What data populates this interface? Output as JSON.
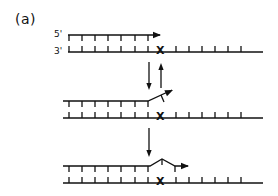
{
  "figure": {
    "panel_label": "(a)",
    "strand_labels": {
      "five_prime": "5'",
      "three_prime": "3'"
    },
    "mismatch_mark": "X",
    "colors": {
      "ink": "#111111",
      "background": "#ffffff"
    },
    "stages": [
      {
        "name": "primer-annealed",
        "description": "Primer annealed to template, extension stops before mismatch X",
        "primer_y": 35,
        "template_y": 52,
        "primer_path": [
          [
            68,
            35
          ],
          [
            160,
            35
          ]
        ],
        "primer_ticks_x": [
          69,
          82,
          95,
          108,
          121,
          135,
          148
        ],
        "template_x_range": [
          68,
          263
        ],
        "template_ticks_x": [
          69,
          82,
          95,
          108,
          121,
          135,
          148,
          176,
          189,
          202,
          215,
          228,
          241
        ],
        "x_mark_x": 161
      },
      {
        "name": "primer-terminus-frayed",
        "description": "Primer 3' end displaced away from template at mismatch",
        "primer_y": 101,
        "template_y": 118,
        "primer_path": [
          [
            63,
            101
          ],
          [
            148,
            101
          ],
          [
            172,
            90
          ]
        ],
        "primer_ticks_x": [
          69,
          82,
          95,
          108,
          121,
          135,
          148
        ],
        "frayed_tick": [
          [
            161,
            95
          ],
          [
            164,
            102
          ]
        ],
        "template_x_range": [
          63,
          263
        ],
        "template_ticks_x": [
          69,
          82,
          95,
          108,
          121,
          135,
          148,
          176,
          189,
          202,
          215,
          228,
          241
        ],
        "x_mark_x": 161
      },
      {
        "name": "mismatch-bypassed",
        "description": "Primer extended past mismatch with bulge at X",
        "primer_y": 166,
        "template_y": 183,
        "primer_path": [
          [
            63,
            166
          ],
          [
            150,
            166
          ],
          [
            162,
            159
          ],
          [
            175,
            166
          ],
          [
            188,
            166
          ]
        ],
        "primer_ticks_x": [
          69,
          82,
          95,
          108,
          121,
          135,
          148,
          162,
          175
        ],
        "template_x_range": [
          63,
          263
        ],
        "template_ticks_x": [
          69,
          82,
          95,
          108,
          121,
          135,
          148,
          176,
          189,
          202,
          215,
          228,
          241
        ],
        "x_mark_x": 161
      }
    ],
    "transitions": [
      {
        "name": "forward-arrow-1",
        "x": 149,
        "from_y": 62,
        "to_y": 90
      },
      {
        "name": "reverse-arrow-1",
        "x": 161,
        "from_y": 88,
        "to_y": 63
      },
      {
        "name": "forward-arrow-2",
        "x": 149,
        "from_y": 128,
        "to_y": 157
      }
    ]
  }
}
